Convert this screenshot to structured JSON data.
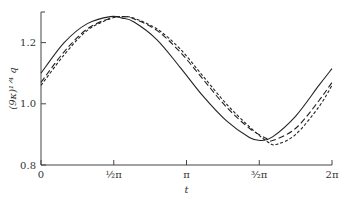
{
  "chart_data": {
    "type": "line",
    "title": "",
    "xlabel": "t",
    "ylabel": "(9κ)^{1/4} q",
    "xlim": [
      0,
      6.2832
    ],
    "ylim": [
      0.8,
      1.3
    ],
    "grid": false,
    "legend": null,
    "x_ticks": [
      {
        "value": 0,
        "label": "0"
      },
      {
        "value": 1.5708,
        "label": "½π"
      },
      {
        "value": 3.1416,
        "label": "π"
      },
      {
        "value": 4.7124,
        "label": "³⁄₂π"
      },
      {
        "value": 6.2832,
        "label": "2π"
      }
    ],
    "y_ticks": [
      {
        "value": 0.8,
        "label": "0.8"
      },
      {
        "value": 1.0,
        "label": "1.0"
      },
      {
        "value": 1.2,
        "label": "1.2"
      }
    ],
    "series": [
      {
        "name": "solid",
        "style": "solid",
        "x": [
          0,
          0.5,
          1.0,
          1.5,
          1.75,
          2.0,
          2.5,
          3.0,
          3.5,
          4.0,
          4.5,
          4.75,
          5.0,
          5.5,
          6.0,
          6.2832
        ],
        "y": [
          1.1,
          1.2,
          1.262,
          1.285,
          1.28,
          1.268,
          1.21,
          1.12,
          1.025,
          0.945,
          0.89,
          0.88,
          0.892,
          0.96,
          1.06,
          1.115
        ]
      },
      {
        "name": "long-dash",
        "style": "dashed",
        "x": [
          0,
          0.5,
          1.0,
          1.5,
          1.75,
          2.0,
          2.5,
          3.0,
          3.5,
          4.0,
          4.5,
          4.85,
          5.0,
          5.5,
          6.0,
          6.2832
        ],
        "y": [
          1.07,
          1.17,
          1.245,
          1.28,
          1.285,
          1.278,
          1.24,
          1.17,
          1.08,
          0.99,
          0.92,
          0.888,
          0.88,
          0.92,
          1.01,
          1.07
        ]
      },
      {
        "name": "short-dash",
        "style": "dotted-dash",
        "x": [
          0,
          0.5,
          1.0,
          1.5,
          1.75,
          2.0,
          2.5,
          3.0,
          3.5,
          4.0,
          4.5,
          4.9,
          5.1,
          5.5,
          6.0,
          6.2832
        ],
        "y": [
          1.06,
          1.16,
          1.24,
          1.278,
          1.285,
          1.28,
          1.245,
          1.18,
          1.09,
          1.0,
          0.925,
          0.875,
          0.868,
          0.9,
          0.99,
          1.06
        ]
      }
    ]
  },
  "layout": {
    "plot_left": 41,
    "plot_right": 332,
    "plot_top": 12,
    "plot_bottom": 165
  }
}
